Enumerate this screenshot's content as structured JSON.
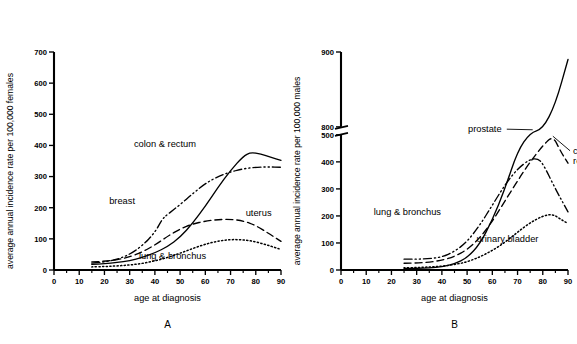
{
  "figure": {
    "panels": [
      {
        "letter": "A",
        "xlabel": "age at diagnosis",
        "ylabel": "average annual incidence rate per 100,000 females",
        "xticks": [
          0,
          10,
          20,
          30,
          40,
          50,
          60,
          70,
          80,
          90
        ],
        "yticks": [
          0,
          100,
          200,
          300,
          400,
          500,
          600,
          700
        ],
        "xlim": [
          0,
          90
        ],
        "ylim": [
          0,
          700
        ],
        "axis_break": false,
        "series": [
          {
            "name": "colon & rectum",
            "style": "solid",
            "label": "colon & rectum",
            "label_x": 44,
            "label_y": 395,
            "leader": false,
            "x": [
              15,
              20,
              25,
              30,
              35,
              40,
              45,
              50,
              55,
              60,
              65,
              70,
              75,
              78,
              82,
              86,
              90
            ],
            "y": [
              18,
              20,
              24,
              30,
              40,
              55,
              75,
              105,
              150,
              205,
              265,
              320,
              365,
              378,
              372,
              362,
              352
            ]
          },
          {
            "name": "breast",
            "style": "dashdotdot",
            "label": "breast",
            "label_x": 27,
            "label_y": 212,
            "leader": false,
            "x": [
              15,
              20,
              25,
              30,
              35,
              40,
              43,
              45,
              50,
              55,
              60,
              65,
              70,
              75,
              80,
              85,
              90
            ],
            "y": [
              22,
              26,
              34,
              50,
              78,
              120,
              165,
              178,
              210,
              245,
              278,
              300,
              315,
              325,
              330,
              331,
              330
            ]
          },
          {
            "name": "uterus",
            "style": "dashed",
            "label": "uterus",
            "label_x": 76,
            "label_y": 172,
            "leader": false,
            "x": [
              15,
              20,
              25,
              30,
              35,
              40,
              45,
              50,
              55,
              60,
              65,
              70,
              75,
              80,
              85,
              90
            ],
            "y": [
              26,
              28,
              33,
              42,
              58,
              80,
              108,
              132,
              148,
              157,
              162,
              163,
              158,
              143,
              118,
              92
            ]
          },
          {
            "name": "lung & bronchus",
            "style": "dotted",
            "label": "lung & bronchus",
            "label_x": 47,
            "label_y": 36,
            "leader": false,
            "x": [
              15,
              20,
              25,
              30,
              35,
              40,
              45,
              50,
              55,
              60,
              65,
              70,
              75,
              80,
              85,
              90
            ],
            "y": [
              10,
              11,
              13,
              16,
              21,
              29,
              40,
              54,
              69,
              83,
              93,
              98,
              97,
              91,
              79,
              66
            ]
          }
        ]
      },
      {
        "letter": "B",
        "xlabel": "age at diagnosis",
        "ylabel": "average annual incidence rate per 100,000 males",
        "xticks": [
          0,
          10,
          20,
          30,
          40,
          50,
          60,
          70,
          80,
          90
        ],
        "yticks": [
          0,
          100,
          200,
          300,
          400,
          500,
          800,
          900
        ],
        "xlim": [
          0,
          90
        ],
        "ylim": [
          0,
          900
        ],
        "axis_break": true,
        "axis_break_range": [
          500,
          800
        ],
        "series": [
          {
            "name": "prostate",
            "style": "solid",
            "label": "prostate",
            "label_x": 57,
            "label_y": 600,
            "leader": true,
            "leader_to_x": 76,
            "leader_to_y": 690,
            "x": [
              25,
              30,
              35,
              40,
              45,
              50,
              55,
              60,
              65,
              70,
              75,
              80,
              85,
              90
            ],
            "y": [
              5,
              6,
              8,
              12,
              22,
              45,
              95,
              185,
              300,
              440,
              580,
              720,
              830,
              890
            ]
          },
          {
            "name": "lung & bronchus",
            "style": "dashdotdot",
            "label": "lung & bronchus",
            "label_x": 13,
            "label_y": 205,
            "leader": false,
            "x": [
              25,
              30,
              35,
              40,
              45,
              50,
              55,
              60,
              65,
              70,
              75,
              78,
              80,
              85,
              90
            ],
            "y": [
              40,
              40,
              42,
              48,
              68,
              105,
              165,
              240,
              315,
              375,
              410,
              412,
              395,
              300,
              215
            ]
          },
          {
            "name": "colon & rectum",
            "style": "dashed",
            "label": "colon & rectum",
            "label_x": 92,
            "label_y": 430,
            "leader": true,
            "leader_to_x": 84,
            "leader_to_y": 495,
            "x": [
              25,
              30,
              35,
              40,
              45,
              50,
              55,
              60,
              65,
              70,
              75,
              80,
              84,
              87,
              90
            ],
            "y": [
              25,
              26,
              29,
              36,
              50,
              75,
              118,
              180,
              255,
              330,
              400,
              460,
              497,
              440,
              395
            ]
          },
          {
            "name": "urinary bladder",
            "style": "dotted",
            "label": "urinary bladder",
            "label_x": 66,
            "label_y": 105,
            "leader": false,
            "x": [
              25,
              30,
              35,
              40,
              45,
              50,
              55,
              60,
              65,
              70,
              75,
              80,
              84,
              87,
              90
            ],
            "y": [
              8,
              9,
              11,
              14,
              20,
              30,
              48,
              72,
              102,
              140,
              175,
              200,
              207,
              188,
              172
            ]
          }
        ]
      }
    ]
  },
  "chart_data": {
    "type": "line",
    "title": "",
    "panels": [
      {
        "panel": "A",
        "xlabel": "age at diagnosis",
        "ylabel": "average annual incidence rate per 100,000 females",
        "xlim": [
          0,
          90
        ],
        "ylim": [
          0,
          700
        ],
        "xticks": [
          0,
          10,
          20,
          30,
          40,
          50,
          60,
          70,
          80,
          90
        ],
        "yticks": [
          0,
          100,
          200,
          300,
          400,
          500,
          600,
          700
        ],
        "grid": false,
        "legend": "inline-annotations",
        "series": [
          {
            "name": "colon & rectum",
            "linestyle": "solid",
            "x": [
              15,
              20,
              25,
              30,
              35,
              40,
              45,
              50,
              55,
              60,
              65,
              70,
              75,
              78,
              82,
              86,
              90
            ],
            "values": [
              18,
              20,
              24,
              30,
              40,
              55,
              75,
              105,
              150,
              205,
              265,
              320,
              365,
              378,
              372,
              362,
              352
            ]
          },
          {
            "name": "breast",
            "linestyle": "dash-dot-dot",
            "x": [
              15,
              20,
              25,
              30,
              35,
              40,
              43,
              45,
              50,
              55,
              60,
              65,
              70,
              75,
              80,
              85,
              90
            ],
            "values": [
              22,
              26,
              34,
              50,
              78,
              120,
              165,
              178,
              210,
              245,
              278,
              300,
              315,
              325,
              330,
              331,
              330
            ]
          },
          {
            "name": "uterus",
            "linestyle": "dashed",
            "x": [
              15,
              20,
              25,
              30,
              35,
              40,
              45,
              50,
              55,
              60,
              65,
              70,
              75,
              80,
              85,
              90
            ],
            "values": [
              26,
              28,
              33,
              42,
              58,
              80,
              108,
              132,
              148,
              157,
              162,
              163,
              158,
              143,
              118,
              92
            ]
          },
          {
            "name": "lung & bronchus",
            "linestyle": "dotted",
            "x": [
              15,
              20,
              25,
              30,
              35,
              40,
              45,
              50,
              55,
              60,
              65,
              70,
              75,
              80,
              85,
              90
            ],
            "values": [
              10,
              11,
              13,
              16,
              21,
              29,
              40,
              54,
              69,
              83,
              93,
              98,
              97,
              91,
              79,
              66
            ]
          }
        ]
      },
      {
        "panel": "B",
        "xlabel": "age at diagnosis",
        "ylabel": "average annual incidence rate per 100,000 males",
        "xlim": [
          0,
          90
        ],
        "ylim": [
          0,
          900
        ],
        "xticks": [
          0,
          10,
          20,
          30,
          40,
          50,
          60,
          70,
          80,
          90
        ],
        "yticks": [
          0,
          100,
          200,
          300,
          400,
          500,
          800,
          900
        ],
        "axis_break": [
          500,
          800
        ],
        "grid": false,
        "legend": "inline-annotations",
        "series": [
          {
            "name": "prostate",
            "linestyle": "solid",
            "x": [
              25,
              30,
              35,
              40,
              45,
              50,
              55,
              60,
              65,
              70,
              75,
              80,
              85,
              90
            ],
            "values": [
              5,
              6,
              8,
              12,
              22,
              45,
              95,
              185,
              300,
              440,
              580,
              720,
              830,
              890
            ]
          },
          {
            "name": "lung & bronchus",
            "linestyle": "dash-dot-dot",
            "x": [
              25,
              30,
              35,
              40,
              45,
              50,
              55,
              60,
              65,
              70,
              75,
              78,
              80,
              85,
              90
            ],
            "values": [
              40,
              40,
              42,
              48,
              68,
              105,
              165,
              240,
              315,
              375,
              410,
              412,
              395,
              300,
              215
            ]
          },
          {
            "name": "colon & rectum",
            "linestyle": "dashed",
            "x": [
              25,
              30,
              35,
              40,
              45,
              50,
              55,
              60,
              65,
              70,
              75,
              80,
              84,
              87,
              90
            ],
            "values": [
              25,
              26,
              29,
              36,
              50,
              75,
              118,
              180,
              255,
              330,
              400,
              460,
              497,
              440,
              395
            ]
          },
          {
            "name": "urinary bladder",
            "linestyle": "dotted",
            "x": [
              25,
              30,
              35,
              40,
              45,
              50,
              55,
              60,
              65,
              70,
              75,
              80,
              84,
              87,
              90
            ],
            "values": [
              8,
              9,
              11,
              14,
              20,
              30,
              48,
              72,
              102,
              140,
              175,
              200,
              207,
              188,
              172
            ]
          }
        ]
      }
    ]
  }
}
